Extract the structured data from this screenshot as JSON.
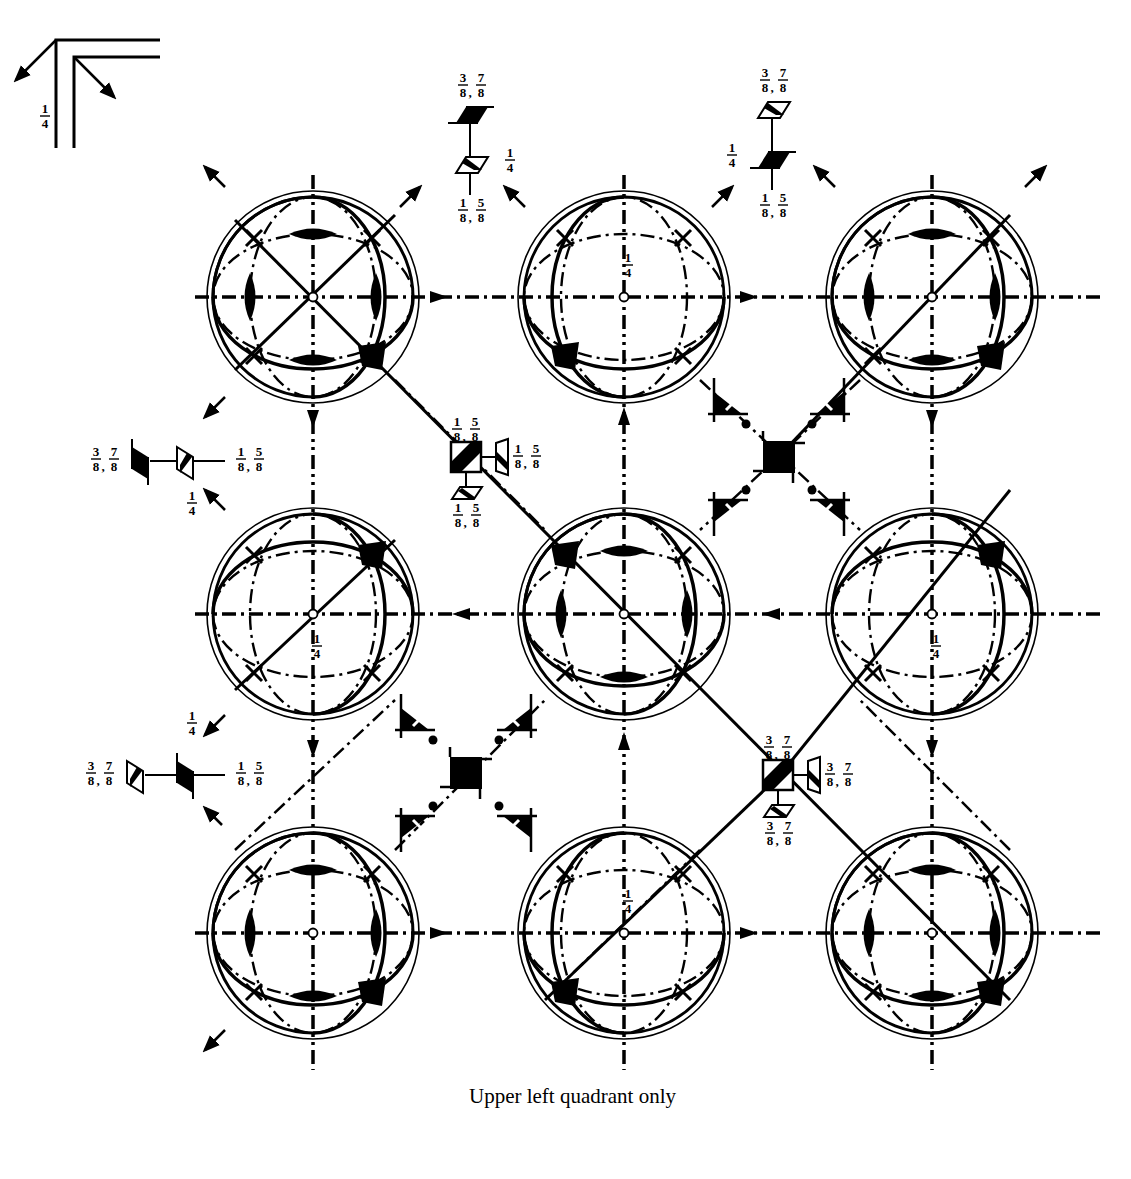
{
  "figure": {
    "caption": "Upper left quadrant only",
    "colors": {
      "ink": "#000000",
      "paper": "#ffffff"
    },
    "corner_key": {
      "label": "1/4"
    },
    "grid": {
      "columns_x": [
        313,
        624,
        932
      ],
      "rows_y": [
        297,
        614,
        933
      ],
      "circle_radius_outer": 106,
      "circle_radius_inner": 100,
      "axis_extent": {
        "left": 195,
        "right": 1100,
        "top": 175,
        "bottom": 1070
      }
    },
    "stereograms": [
      {
        "id": "r1c1",
        "cx": 313,
        "cy": 297,
        "type": "A",
        "quarter_label": ""
      },
      {
        "id": "r1c2",
        "cx": 624,
        "cy": 297,
        "type": "B",
        "quarter_label": "1/4"
      },
      {
        "id": "r1c3",
        "cx": 932,
        "cy": 297,
        "type": "A",
        "quarter_label": ""
      },
      {
        "id": "r2c1",
        "cx": 313,
        "cy": 614,
        "type": "C",
        "quarter_label": "1/4"
      },
      {
        "id": "r2c2",
        "cx": 624,
        "cy": 614,
        "type": "D",
        "quarter_label": ""
      },
      {
        "id": "r2c3",
        "cx": 932,
        "cy": 614,
        "type": "C",
        "quarter_label": "1/4"
      },
      {
        "id": "r3c1",
        "cx": 313,
        "cy": 933,
        "type": "A",
        "quarter_label": ""
      },
      {
        "id": "r3c2",
        "cx": 624,
        "cy": 933,
        "type": "B",
        "quarter_label": "1/4"
      },
      {
        "id": "r3c3",
        "cx": 932,
        "cy": 933,
        "type": "A",
        "quarter_label": ""
      }
    ],
    "symbol_groups": [
      {
        "id": "top-left-axis",
        "x": 470,
        "y_top": 115,
        "y_bottom": 165,
        "top_label": "3/8,7/8",
        "bottom_label": "1/8,5/8",
        "side_label": "1/4",
        "top_filled": true
      },
      {
        "id": "top-right-axis",
        "x": 772,
        "y_top": 110,
        "y_bottom": 160,
        "top_label": "3/8,7/8",
        "bottom_label": "1/8,5/8",
        "side_label": "1/4",
        "top_filled": false
      },
      {
        "id": "left-upper-axis",
        "x_left": 140,
        "x_right": 185,
        "y": 461,
        "left_label": "3/8,7/8",
        "right_label": "1/8,5/8",
        "side_label": "1/4",
        "left_filled": true
      },
      {
        "id": "left-lower-axis",
        "x_left": 135,
        "x_right": 185,
        "y": 775,
        "left_label": "3/8,7/8",
        "right_label": "1/8,5/8",
        "side_label": "1/4",
        "left_filled": false
      }
    ],
    "boxed_centers": [
      {
        "id": "center-upper",
        "x": 466,
        "y": 457,
        "top_label": "1/8,5/8",
        "right_label": "1/8,5/8",
        "bottom_label": "1/8,5/8"
      },
      {
        "id": "center-lower",
        "x": 778,
        "y": 775,
        "top_label": "3/8,7/8",
        "right_label": "3/8,7/8",
        "bottom_label": "3/8,7/8"
      }
    ],
    "filled_squares": [
      {
        "id": "square-right",
        "x": 779,
        "y": 457
      },
      {
        "id": "square-left",
        "x": 466,
        "y": 773
      }
    ]
  }
}
